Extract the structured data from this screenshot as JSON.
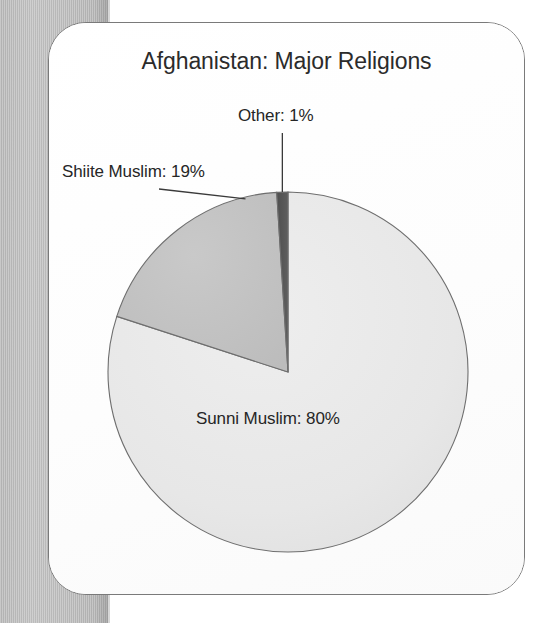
{
  "page": {
    "background_color": "#ffffff",
    "paper_strip_color": "#bdbdbd",
    "card_border_color": "#7a7a7a"
  },
  "chart_data": {
    "type": "pie",
    "title": "Afghanistan: Major Religions",
    "xlabel": "",
    "ylabel": "",
    "legend_position": "none",
    "grid": false,
    "categories": [
      "Sunni Muslim",
      "Shiite Muslim",
      "Other"
    ],
    "values": [
      80,
      19,
      1
    ],
    "units": "percent",
    "total": 100,
    "start_angle_deg": 0,
    "direction": "clockwise",
    "slices": [
      {
        "name": "Sunni Muslim",
        "value": 80,
        "label": "Sunni Muslim: 80%",
        "color": "#e9e9e9",
        "label_placement": "inside",
        "has_leader_line": false
      },
      {
        "name": "Shiite Muslim",
        "value": 19,
        "label": "Shiite Muslim: 19%",
        "color": "#c2c2c2",
        "label_placement": "outside-left",
        "has_leader_line": true
      },
      {
        "name": "Other",
        "value": 1,
        "label": "Other: 1%",
        "color": "#555555",
        "label_placement": "outside-top",
        "has_leader_line": true
      }
    ],
    "slice_outline_color": "#6e6e6e"
  },
  "labels": {
    "other": "Other: 1%",
    "shiite": "Shiite Muslim: 19%",
    "sunni": "Sunni Muslim: 80%"
  }
}
